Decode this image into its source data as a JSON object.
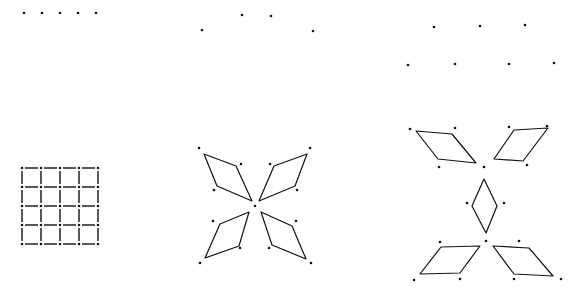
{
  "figure": {
    "width": 576,
    "height": 298,
    "background": "#ffffff",
    "ink": "#111111",
    "panels": [
      {
        "id": "panel-1",
        "top_dots": [
          [
            24,
            13
          ],
          [
            42,
            13
          ],
          [
            60,
            13
          ],
          [
            78,
            13
          ],
          [
            96,
            13
          ]
        ],
        "grid": {
          "x0": 22,
          "y0": 168,
          "cols": 5,
          "rows": 5,
          "step_x": 19,
          "step_y": 19,
          "style": "dashed"
        }
      },
      {
        "id": "panel-2",
        "top_dots": [
          [
            202,
            30
          ],
          [
            242,
            15
          ],
          [
            271,
            16
          ],
          [
            313,
            31
          ]
        ],
        "center_dot": [
          255,
          206
        ],
        "free_dots": [
          [
            199,
            148
          ],
          [
            241,
            164
          ],
          [
            214,
            190
          ],
          [
            310,
            148
          ],
          [
            270,
            164
          ],
          [
            297,
            190
          ],
          [
            213,
            221
          ],
          [
            240,
            248
          ],
          [
            200,
            263
          ],
          [
            296,
            221
          ],
          [
            269,
            248
          ],
          [
            311,
            263
          ]
        ],
        "rhombi": [
          [
            [
              204,
              154
            ],
            [
              236,
              166
            ],
            [
              252,
              201
            ],
            [
              217,
              186
            ]
          ],
          [
            [
              307,
              154
            ],
            [
              274,
              166
            ],
            [
              259,
              201
            ],
            [
              295,
              186
            ]
          ],
          [
            [
              249,
              212
            ],
            [
              220,
              224
            ],
            [
              205,
              258
            ],
            [
              239,
              246
            ]
          ],
          [
            [
              261,
              212
            ],
            [
              292,
              226
            ],
            [
              306,
              259
            ],
            [
              272,
              245
            ]
          ]
        ]
      },
      {
        "id": "panel-3",
        "top_dots": [
          [
            434,
            27
          ],
          [
            480,
            26
          ],
          [
            525,
            25
          ],
          [
            408,
            65
          ],
          [
            455,
            64
          ],
          [
            509,
            64
          ],
          [
            554,
            63
          ]
        ],
        "free_dots": [
          [
            410,
            129
          ],
          [
            455,
            128
          ],
          [
            439,
            167
          ],
          [
            484,
            167
          ],
          [
            509,
            127
          ],
          [
            547,
            126
          ],
          [
            527,
            165
          ],
          [
            467,
            203
          ],
          [
            504,
            203
          ],
          [
            486,
            241
          ],
          [
            440,
            242
          ],
          [
            519,
            241
          ],
          [
            414,
            280
          ],
          [
            460,
            279
          ],
          [
            514,
            279
          ],
          [
            561,
            279
          ]
        ],
        "rhombi": [
          [
            [
              416,
              131
            ],
            [
              452,
              134
            ],
            [
              476,
              163
            ],
            [
              438,
              159
            ]
          ],
          [
            [
              514,
              130
            ],
            [
              548,
              128
            ],
            [
              523,
              161
            ],
            [
              494,
              159
            ]
          ],
          [
            [
              484,
              179
            ],
            [
              497,
              206
            ],
            [
              486,
              233
            ],
            [
              472,
              206
            ]
          ],
          [
            [
              441,
              247
            ],
            [
              480,
              246
            ],
            [
              460,
              273
            ],
            [
              420,
              274
            ]
          ],
          [
            [
              493,
              246
            ],
            [
              529,
              248
            ],
            [
              553,
              276
            ],
            [
              514,
              274
            ]
          ]
        ]
      }
    ]
  }
}
